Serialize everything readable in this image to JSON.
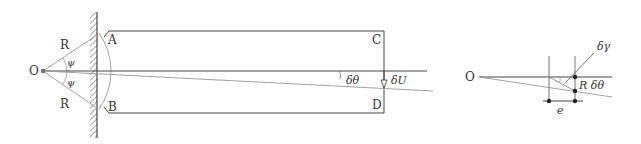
{
  "colors": {
    "line": "#444444",
    "light_line": "#999999",
    "text": "#333333",
    "background": "#ffffff"
  },
  "left_figure": {
    "pivot_label": "O",
    "radius_upper_label": "R",
    "radius_lower_label": "R",
    "angle_upper_label": "ψ",
    "angle_lower_label": "ψ",
    "corner_top_left": "A",
    "corner_bottom_left": "B",
    "corner_top_right": "C",
    "corner_bottom_right": "D",
    "rotation_label": "δθ",
    "displacement_label": "δU"
  },
  "right_figure": {
    "pivot_label": "O",
    "shear_label": "δγ",
    "arc_label": "R δθ",
    "offset_label": "e"
  }
}
